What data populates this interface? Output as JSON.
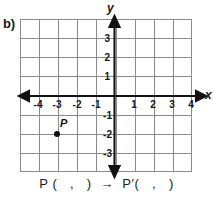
{
  "problem": {
    "label": "b)"
  },
  "graph": {
    "axis_labels": {
      "x": "x",
      "y": "y"
    },
    "x_ticks": [
      {
        "value": -4,
        "label": "-4"
      },
      {
        "value": -3,
        "label": "-3"
      },
      {
        "value": -2,
        "label": "-2"
      },
      {
        "value": -1,
        "label": "-1"
      },
      {
        "value": 1,
        "label": "1"
      },
      {
        "value": 2,
        "label": "2"
      },
      {
        "value": 3,
        "label": "3"
      },
      {
        "value": 4,
        "label": "4"
      }
    ],
    "y_ticks": [
      {
        "value": 3,
        "label": "3"
      },
      {
        "value": 2,
        "label": "2"
      },
      {
        "value": 1,
        "label": "1"
      },
      {
        "value": -1,
        "label": "-1"
      },
      {
        "value": -2,
        "label": "-2"
      },
      {
        "value": -3,
        "label": "-3"
      }
    ],
    "xlim": [
      -4.7,
      4.0
    ],
    "ylim": [
      -4.0,
      3.8
    ],
    "grid": true,
    "grid_color": "#8a8a8f",
    "axis_color": "#121216",
    "points": [
      {
        "name": "P",
        "x": -3,
        "y": -2
      }
    ]
  },
  "answer_line": {
    "source_prefix": "P (",
    "comma": ",",
    "source_suffix": ")",
    "arrow": "→",
    "image_prefix": "P′(",
    "image_suffix": ")",
    "full_text": "P (   ,   )  →  P′(   ,   )"
  }
}
